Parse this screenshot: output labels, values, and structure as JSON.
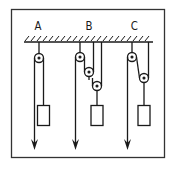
{
  "diagram": {
    "labels": {
      "a": "A",
      "b": "B",
      "c": "C"
    },
    "systems": [
      {
        "id": "A",
        "description": "Single fixed pulley; effort arrow pulls down, load hangs from the other side",
        "pulleys": 1
      },
      {
        "id": "B",
        "description": "Fixed pulley plus two movable pulleys; effort arrow pulls down",
        "pulleys": 3
      },
      {
        "id": "C",
        "description": "Fixed pulley plus one movable pulley; effort arrow pulls down",
        "pulleys": 2
      }
    ],
    "colors": {
      "stroke": "#1a1a1a",
      "background": "#ffffff",
      "frame": "#333333"
    }
  }
}
